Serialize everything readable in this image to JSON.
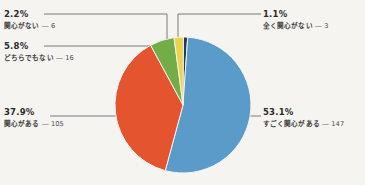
{
  "chart_data": {
    "type": "pie",
    "title": "",
    "subtitle": "",
    "xlabel": "",
    "ylabel": "",
    "legend_position": "callout-labels",
    "grid": false,
    "total": 277,
    "categories": [
      "すごく関心がある",
      "関心がある",
      "どちらでもない",
      "関心がない",
      "全く関心がない"
    ],
    "values": [
      147,
      105,
      16,
      6,
      3
    ],
    "percentages": [
      53.1,
      37.9,
      5.8,
      2.2,
      1.1
    ],
    "colors": [
      "#5b9bc9",
      "#e3542f",
      "#73ad48",
      "#e8d44d",
      "#1f3864"
    ],
    "slices": [
      {
        "label": "すごく関心がある",
        "percent_text": "53.1%",
        "value": 147,
        "value_text": "147",
        "color": "#5b9bc9"
      },
      {
        "label": "関心がある",
        "percent_text": "37.9%",
        "value": 105,
        "value_text": "105",
        "color": "#e3542f"
      },
      {
        "label": "どちらでもない",
        "percent_text": "5.8%",
        "value": 16,
        "value_text": "16",
        "color": "#73ad48"
      },
      {
        "label": "関心がない",
        "percent_text": "2.2%",
        "value": 6,
        "value_text": "6",
        "color": "#e8d44d"
      },
      {
        "label": "全く関心がない",
        "percent_text": "1.1%",
        "value": 3,
        "value_text": "3",
        "color": "#1f3864"
      }
    ],
    "separator": "―"
  },
  "labels": {
    "yellow": {
      "percent": "2.2%",
      "category": "関心がない",
      "sep": "―",
      "count": "6"
    },
    "green": {
      "percent": "5.8%",
      "category": "どちらでもない",
      "sep": "―",
      "count": "16"
    },
    "orange": {
      "percent": "37.9%",
      "category": "関心がある",
      "sep": "―",
      "count": "105"
    },
    "navy": {
      "percent": "1.1%",
      "category": "全く関心がない",
      "sep": "―",
      "count": "3"
    },
    "blue": {
      "percent": "53.1%",
      "category": "すごく関心がある",
      "sep": "―",
      "count": "147"
    }
  },
  "style": {
    "background": "#f6f4f1",
    "leader_line_color": "#5a5a5a",
    "text_color": "#2b2b2b"
  }
}
